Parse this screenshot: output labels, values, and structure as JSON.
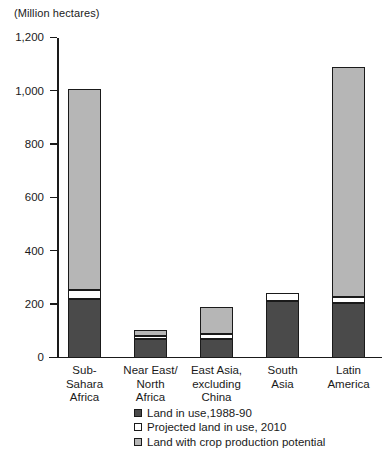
{
  "chart_data": {
    "type": "bar",
    "subtype": "stacked",
    "title": "",
    "xlabel": "",
    "ylabel": "(Million hectares)",
    "ylim": [
      0,
      1200
    ],
    "ytick_values": [
      0,
      200,
      400,
      600,
      800,
      1000,
      1200
    ],
    "ytick_labels": [
      "0",
      "200",
      "400",
      "600",
      "800",
      "1,000",
      "1,200"
    ],
    "grid": false,
    "legend_position": "bottom",
    "categories": [
      "Sub-\nSahara\nAfrica",
      "Near East/\nNorth\nAfrica",
      "East Asia,\nexcluding\nChina",
      "South\nAsia",
      "Latin\nAmerica"
    ],
    "series": [
      {
        "name": "Land in use,1988-90",
        "color": "#4a4a4a",
        "values": [
          222,
          72,
          73,
          212,
          205
        ]
      },
      {
        "name": "Projected land in use, 2010",
        "color": "#ffffff",
        "values": [
          33,
          10,
          17,
          33,
          25
        ]
      },
      {
        "name": "Land with crop production potential",
        "color": "#b6b6b6",
        "values": [
          755,
          23,
          100,
          0,
          860
        ]
      }
    ],
    "totals": [
      1010,
      105,
      190,
      245,
      1090
    ]
  },
  "legend": {
    "items": [
      {
        "label": "Land in use,1988-90",
        "swatch": "#4a4a4a"
      },
      {
        "label": "Projected land in use, 2010",
        "swatch": "#ffffff"
      },
      {
        "label": "Land with crop production potential",
        "swatch": "#b6b6b6"
      }
    ]
  }
}
